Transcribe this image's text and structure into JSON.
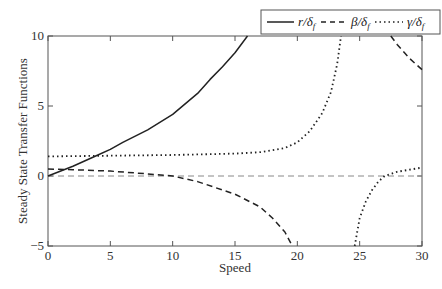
{
  "chart_data": {
    "type": "line",
    "title": "",
    "xlabel": "Speed",
    "ylabel": "Steady State Transfer Functions",
    "xlim": [
      0,
      30
    ],
    "ylim": [
      -5,
      10
    ],
    "xticks": [
      "0",
      "5",
      "10",
      "15",
      "20",
      "25",
      "30"
    ],
    "yticks": [
      "10",
      "5",
      "0",
      "−5"
    ],
    "grid": false,
    "legend_position": "top-right (above plot)",
    "reference_line": {
      "y": 0,
      "style": "dashed",
      "color": "#888888"
    },
    "series": [
      {
        "name": "r/δf",
        "style": "solid",
        "color": "#222222",
        "x": [
          0,
          2,
          4,
          5,
          6,
          8,
          10,
          12,
          13,
          14,
          15,
          16
        ],
        "y": [
          0,
          0.7,
          1.5,
          1.9,
          2.4,
          3.3,
          4.4,
          5.9,
          6.9,
          7.8,
          8.8,
          10
        ]
      },
      {
        "name": "β/δf",
        "style": "dashed",
        "color": "#222222",
        "branches": [
          {
            "x": [
              0,
              2,
              5,
              8,
              10,
              12,
              15,
              17,
              18,
              19,
              19.6
            ],
            "y": [
              0.5,
              0.45,
              0.35,
              0.15,
              0,
              -0.4,
              -1.3,
              -2.2,
              -3,
              -4,
              -5
            ]
          },
          {
            "x": [
              27.5,
              28,
              29,
              30
            ],
            "y": [
              10,
              9.4,
              8.4,
              7.6
            ]
          }
        ]
      },
      {
        "name": "γ/δf",
        "style": "dotted",
        "color": "#222222",
        "branches": [
          {
            "x": [
              0,
              5,
              10,
              15,
              17,
              19,
              20,
              21,
              22,
              22.7,
              23.2,
              23.5
            ],
            "y": [
              1.4,
              1.45,
              1.5,
              1.6,
              1.7,
              2.0,
              2.4,
              3.2,
              4.5,
              6.0,
              8.0,
              10
            ]
          },
          {
            "x": [
              24.6,
              24.8,
              25,
              25.5,
              26,
              26.5,
              27,
              28,
              29,
              30
            ],
            "y": [
              -5,
              -4,
              -3,
              -1.8,
              -1,
              -0.4,
              0,
              0.3,
              0.45,
              0.6
            ]
          }
        ]
      }
    ]
  },
  "legend": {
    "items": [
      {
        "label": "r/δ",
        "sub": "f",
        "style": "solid"
      },
      {
        "label": "β/δ",
        "sub": "f",
        "style": "dashed"
      },
      {
        "label": "γ/δ",
        "sub": "f",
        "style": "dotted"
      }
    ]
  },
  "axes": {
    "xlabel": "Speed",
    "ylabel": "Steady State Transfer Functions",
    "xticks": [
      "0",
      "5",
      "10",
      "15",
      "20",
      "25",
      "30"
    ],
    "yticks": [
      "10",
      "5",
      "0",
      "−5"
    ]
  }
}
